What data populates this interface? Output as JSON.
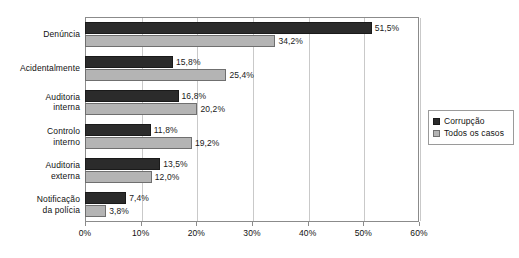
{
  "chart_data": {
    "type": "bar",
    "orientation": "horizontal",
    "title": "",
    "subtitle": "",
    "xlabel": "",
    "ylabel": "",
    "xlim": [
      0,
      60
    ],
    "xticks": [
      "0%",
      "10%",
      "20%",
      "30%",
      "40%",
      "50%",
      "60%"
    ],
    "xtick_values": [
      0,
      10,
      20,
      30,
      40,
      50,
      60
    ],
    "grid": "vertical",
    "legend_position": "right",
    "categories": [
      "Denúncia",
      "Acidentalmente",
      "Auditoria interna",
      "Controlo interno",
      "Auditoria externa",
      "Notificação da polícia"
    ],
    "category_lines": [
      [
        "Denúncia"
      ],
      [
        "Acidentalmente"
      ],
      [
        "Auditoria",
        "interna"
      ],
      [
        "Controlo",
        "interno"
      ],
      [
        "Auditoria",
        "externa"
      ],
      [
        "Notificação",
        "da polícia"
      ]
    ],
    "series": [
      {
        "name": "Corrupção",
        "color": "#2b2b2b",
        "values": [
          51.5,
          15.8,
          16.8,
          11.8,
          13.5,
          7.4
        ],
        "labels": [
          "51,5%",
          "15,8%",
          "16,8%",
          "11,8%",
          "13,5%",
          "7,4%"
        ]
      },
      {
        "name": "Todos os casos",
        "color": "#b4b4b4",
        "values": [
          34.2,
          25.4,
          20.2,
          19.2,
          12.0,
          3.8
        ],
        "labels": [
          "34,2%",
          "25,4%",
          "20,2%",
          "19,2%",
          "12,0%",
          "3,8%"
        ]
      }
    ]
  },
  "legend": {
    "items": [
      {
        "label": "Corrupção",
        "color": "#2b2b2b"
      },
      {
        "label": "Todos os casos",
        "color": "#b4b4b4"
      }
    ]
  },
  "page": {
    "top_bleed_text": ""
  }
}
